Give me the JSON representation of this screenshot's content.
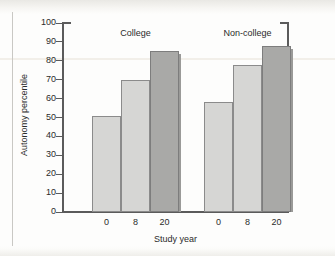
{
  "chart_data": {
    "type": "bar",
    "title": "",
    "xlabel": "Study year",
    "ylabel": "Autonomy percentile",
    "ylim": [
      0,
      100
    ],
    "ytick_step": 10,
    "yticks": [
      100,
      90,
      80,
      70,
      60,
      50,
      40,
      30,
      20,
      10,
      0
    ],
    "grid": false,
    "legend": "none",
    "categories": [
      "0",
      "8",
      "20"
    ],
    "groups": [
      {
        "name": "College",
        "label": "College",
        "bars": [
          {
            "category": "0",
            "value": 51,
            "shade": "light"
          },
          {
            "category": "8",
            "value": 70,
            "shade": "light"
          },
          {
            "category": "20",
            "value": 85,
            "shade": "dark"
          }
        ]
      },
      {
        "name": "Non-college",
        "label": "Non-college",
        "bars": [
          {
            "category": "0",
            "value": 58,
            "shade": "light"
          },
          {
            "category": "8",
            "value": 78,
            "shade": "light"
          },
          {
            "category": "20",
            "value": 88,
            "shade": "dark"
          }
        ]
      }
    ],
    "series": [
      {
        "name": "College",
        "values": [
          51,
          70,
          85
        ]
      },
      {
        "name": "Non-college",
        "values": [
          58,
          78,
          88
        ]
      }
    ],
    "colors": {
      "bar_light": "#d6d6d4",
      "bar_dark": "#a9a9a7",
      "bar_outline": "#8b8b8b",
      "axis": "#5b5b5b",
      "text": "#2b2b2b",
      "background": "#fdfdfc"
    }
  }
}
